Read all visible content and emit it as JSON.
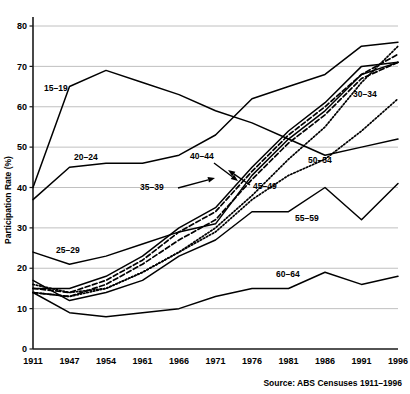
{
  "chart_data": {
    "type": "line",
    "title": "",
    "subtitle": "",
    "xlabel": "",
    "ylabel": "Participation Rate (%)",
    "ylim": [
      0,
      80
    ],
    "yticks": [
      0,
      10,
      20,
      30,
      40,
      50,
      60,
      70,
      80
    ],
    "ytick_labels": [
      "0",
      "10",
      "20",
      "30",
      "40",
      "50",
      "60",
      "70",
      "80"
    ],
    "grid": true,
    "legend_position": "inline-annotations",
    "x": [
      1911,
      1947,
      1954,
      1961,
      1966,
      1971,
      1976,
      1981,
      1986,
      1991,
      1996
    ],
    "xtick_labels": [
      "1911",
      "1947",
      "1954",
      "1961",
      "1966",
      "1971",
      "1976",
      "1981",
      "1986",
      "1991",
      "1996"
    ],
    "source": "Source: ABS Censuses 1911–1996",
    "series": [
      {
        "name": "15–19",
        "label": "15–19",
        "style": "solid",
        "values": [
          40,
          65,
          69,
          66,
          63,
          59,
          56,
          52,
          48,
          50,
          52
        ]
      },
      {
        "name": "20–24",
        "label": "20–24",
        "style": "solid",
        "values": [
          37,
          45,
          46,
          46,
          48,
          53,
          62,
          65,
          68,
          75,
          76
        ]
      },
      {
        "name": "25–29",
        "label": "25–29",
        "style": "solid",
        "values": [
          24,
          21,
          23,
          26,
          29,
          31,
          43,
          52,
          59,
          68,
          71
        ]
      },
      {
        "name": "30–34",
        "label": "30–34",
        "style": "dotted",
        "values": [
          16,
          14,
          15,
          19,
          24,
          30,
          38,
          47,
          55,
          66,
          75
        ]
      },
      {
        "name": "35–39",
        "label": "35–39",
        "style": "dashed",
        "values": [
          15,
          14,
          17,
          22,
          29,
          34,
          44,
          53,
          60,
          68,
          73
        ]
      },
      {
        "name": "40–44",
        "label": "40–44",
        "style": "solid",
        "values": [
          15,
          15,
          18,
          23,
          30,
          35,
          45,
          54,
          61,
          70,
          71
        ]
      },
      {
        "name": "45–49",
        "label": "45–49",
        "style": "dashed",
        "values": [
          14,
          13,
          16,
          21,
          27,
          32,
          42,
          51,
          58,
          67,
          71
        ]
      },
      {
        "name": "50–54",
        "label": "50–54",
        "style": "dotted",
        "values": [
          14,
          13,
          15,
          19,
          24,
          29,
          37,
          43,
          47,
          54,
          62
        ]
      },
      {
        "name": "55–59",
        "label": "55–59",
        "style": "solid",
        "values": [
          17,
          12,
          14,
          17,
          23,
          27,
          34,
          34,
          40,
          32,
          41
        ]
      },
      {
        "name": "60–64",
        "label": "60–64",
        "style": "solid",
        "values": [
          14,
          9,
          8,
          9,
          10,
          13,
          15,
          15,
          19,
          16,
          18
        ]
      }
    ],
    "annotations": [
      {
        "text": "15–19",
        "x_px": 44,
        "y_px": 91,
        "leader": false
      },
      {
        "text": "20–24",
        "x_px": 74,
        "y_px": 160,
        "leader": false
      },
      {
        "text": "25–29",
        "x_px": 56,
        "y_px": 253,
        "leader": false
      },
      {
        "text": "30–34",
        "x_px": 353,
        "y_px": 97,
        "leader": false
      },
      {
        "text": "35–39",
        "x_px": 140,
        "y_px": 190,
        "leader": true
      },
      {
        "text": "40–44",
        "x_px": 190,
        "y_px": 159,
        "leader": true
      },
      {
        "text": "45–49",
        "x_px": 253,
        "y_px": 189,
        "leader": true
      },
      {
        "text": "50–54",
        "x_px": 308,
        "y_px": 163,
        "leader": false
      },
      {
        "text": "55–59",
        "x_px": 295,
        "y_px": 221,
        "leader": false
      },
      {
        "text": "60–64",
        "x_px": 276,
        "y_px": 277,
        "leader": false
      }
    ]
  }
}
